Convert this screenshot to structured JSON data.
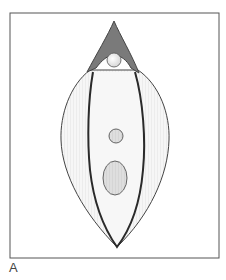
{
  "figure": {
    "panel_label": "A",
    "colors": {
      "frame": "#555555",
      "outline": "#333333",
      "tip_fill": "#7a7a7a",
      "body_fill": "#f4f4f4",
      "organelle_fill": "#dcdcdc",
      "sphere_fill": "#f7f7f7"
    }
  }
}
